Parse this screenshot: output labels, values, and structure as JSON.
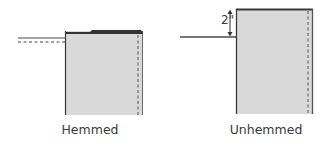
{
  "diagram": {
    "panels": [
      {
        "id": "hemmed",
        "label": "Hemmed",
        "fill": "#d9d9d9",
        "edge_color": "#3a3a3a",
        "has_dashed_ground_line": true,
        "has_dimension": false
      },
      {
        "id": "unhemmed",
        "label": "Unhemmed",
        "fill": "#d9d9d9",
        "edge_color": "#3a3a3a",
        "has_dashed_ground_line": false,
        "has_dimension": true,
        "dimension_label": "2\""
      }
    ]
  }
}
